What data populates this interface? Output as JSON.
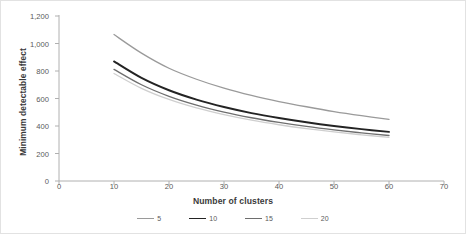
{
  "chart_data": {
    "type": "line",
    "title": "",
    "xlabel": "Number of clusters",
    "ylabel": "Minimum detectable effect",
    "xlim": [
      0,
      70
    ],
    "ylim": [
      0,
      1200
    ],
    "xticks": [
      "0",
      "10",
      "20",
      "30",
      "40",
      "50",
      "60",
      "70"
    ],
    "xtick_values": [
      0,
      10,
      20,
      30,
      40,
      50,
      60,
      70
    ],
    "yticks": [
      "0",
      "200",
      "400",
      "600",
      "800",
      "1,000",
      "1,200"
    ],
    "ytick_values": [
      0,
      200,
      400,
      600,
      800,
      1000,
      1200
    ],
    "grid": false,
    "legend_position": "bottom",
    "x": [
      10,
      15,
      20,
      25,
      30,
      35,
      40,
      45,
      50,
      55,
      60
    ],
    "series": [
      {
        "name": "5",
        "label": "5",
        "color": "#9a9a9a",
        "width": 1.3,
        "values": [
          1065,
          930,
          820,
          740,
          675,
          622,
          578,
          540,
          505,
          475,
          448
        ]
      },
      {
        "name": "10",
        "label": "10",
        "color": "#232323",
        "width": 1.9,
        "values": [
          870,
          750,
          660,
          592,
          538,
          494,
          458,
          427,
          400,
          377,
          357
        ]
      },
      {
        "name": "15",
        "label": "15",
        "color": "#6e6e6e",
        "width": 1.3,
        "values": [
          812,
          700,
          616,
          552,
          501,
          460,
          426,
          397,
          372,
          350,
          331
        ]
      },
      {
        "name": "20",
        "label": "20",
        "color": "#cfcfcf",
        "width": 1.3,
        "values": [
          782,
          674,
          593,
          531,
          482,
          442,
          409,
          381,
          357,
          336,
          318
        ]
      }
    ],
    "axis_color": "#b0b0b0",
    "tick_color": "#b0b0b0",
    "text_color": "#3a3a3a"
  }
}
